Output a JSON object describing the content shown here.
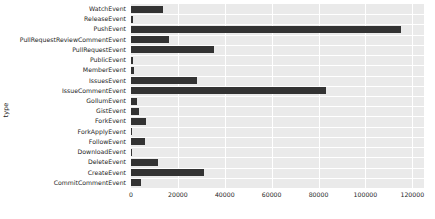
{
  "chart_data": {
    "type": "bar",
    "orientation": "horizontal",
    "title": "",
    "xlabel": "",
    "ylabel": "type",
    "xlim": [
      0,
      125000
    ],
    "ylim": null,
    "grid": true,
    "legend": null,
    "bar_color": "#333333",
    "plot_background": "#eaeaea",
    "gridline_color": "#ffffff",
    "xticks": [
      0,
      20000,
      40000,
      60000,
      80000,
      100000,
      120000
    ],
    "xtick_labels": [
      "0",
      "20000",
      "40000",
      "60000",
      "80000",
      "100000",
      "120000"
    ],
    "categories": [
      "WatchEvent",
      "ReleaseEvent",
      "PushEvent",
      "PullRequestReviewCommentEvent",
      "PullRequestEvent",
      "PublicEvent",
      "MemberEvent",
      "IssuesEvent",
      "IssueCommentEvent",
      "GollumEvent",
      "GistEvent",
      "ForkEvent",
      "ForkApplyEvent",
      "FollowEvent",
      "DownloadEvent",
      "DeleteEvent",
      "CreateEvent",
      "CommitCommentEvent"
    ],
    "values": [
      13500,
      700,
      115000,
      16000,
      35500,
      800,
      1100,
      28000,
      83000,
      2400,
      3400,
      6500,
      300,
      5800,
      600,
      11500,
      31000,
      4200
    ]
  }
}
